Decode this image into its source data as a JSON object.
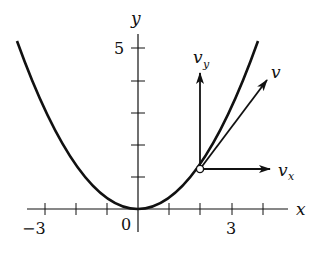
{
  "diagram": {
    "axes": {
      "x_label": "x",
      "y_label": "y",
      "x_tick_labels": [
        {
          "value": "−3",
          "x": -3
        },
        {
          "value": "0",
          "x": 0
        },
        {
          "value": "3",
          "x": 3
        }
      ],
      "y_tick_labels": [
        {
          "value": "5",
          "y": 5
        }
      ],
      "x_ticks": [
        -3,
        -2,
        -1,
        1,
        2,
        3,
        4
      ],
      "y_ticks": [
        1,
        2,
        3,
        4,
        5
      ]
    },
    "curve": {
      "type": "parabola",
      "equation": "y = x^2/3"
    },
    "point": {
      "x": 2,
      "y": 1.33,
      "style": "open-circle"
    },
    "vectors": [
      {
        "name": "v_x",
        "label_main": "v",
        "label_sub": "x",
        "direction": "horizontal"
      },
      {
        "name": "v_y",
        "label_main": "v",
        "label_sub": "y",
        "direction": "vertical"
      },
      {
        "name": "v",
        "label_main": "v",
        "label_sub": "",
        "direction": "tangent"
      }
    ],
    "colors": {
      "ink": "#111111",
      "background": "#ffffff"
    }
  }
}
